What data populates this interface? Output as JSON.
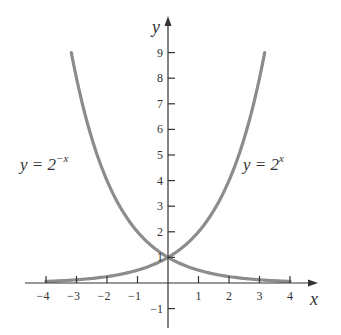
{
  "chart_data": {
    "type": "line",
    "title": "",
    "xlabel": "x",
    "ylabel": "y",
    "xlim": [
      -4.5,
      4.9
    ],
    "ylim": [
      -1.8,
      10.5
    ],
    "grid": false,
    "legend": "none (inline curve labels)",
    "x_ticks": [
      -4,
      -3,
      -2,
      -1,
      1,
      2,
      3,
      4
    ],
    "x_tick_labels": [
      "−4",
      "−3",
      "−2",
      "−1",
      "1",
      "2",
      "3",
      "4"
    ],
    "y_ticks": [
      -1,
      1,
      2,
      3,
      4,
      5,
      6,
      7,
      8,
      9
    ],
    "y_tick_labels": [
      "−1",
      "1",
      "2",
      "3",
      "4",
      "5",
      "6",
      "7",
      "8",
      "9"
    ],
    "series": [
      {
        "name": "y = 2^-x",
        "label_base": "y = 2",
        "label_exp": "−x",
        "x": [
          -3.17,
          -3,
          -2.5,
          -2,
          -1.5,
          -1,
          -0.5,
          0,
          0.5,
          1,
          1.5,
          2,
          2.5,
          3,
          3.5,
          4
        ],
        "values": [
          9.0,
          8.0,
          5.66,
          4.0,
          2.83,
          2.0,
          1.41,
          1.0,
          0.71,
          0.5,
          0.35,
          0.25,
          0.18,
          0.125,
          0.09,
          0.0625
        ]
      },
      {
        "name": "y = 2^x",
        "label_base": "y = 2",
        "label_exp": "x",
        "x": [
          -4,
          -3.5,
          -3,
          -2.5,
          -2,
          -1.5,
          -1,
          -0.5,
          0,
          0.5,
          1,
          1.5,
          2,
          2.5,
          3,
          3.17
        ],
        "values": [
          0.0625,
          0.09,
          0.125,
          0.18,
          0.25,
          0.35,
          0.5,
          0.71,
          1.0,
          1.41,
          2.0,
          2.83,
          4.0,
          5.66,
          8.0,
          9.0
        ]
      }
    ],
    "annotations": [
      {
        "text": "y = 2^−x",
        "near": [
          -3.8,
          5.2
        ]
      },
      {
        "text": "y = 2^x",
        "near": [
          2.6,
          5.2
        ]
      }
    ]
  },
  "colors": {
    "curve": "#8c8c8c",
    "axis": "#333333",
    "background": "#ffffff"
  }
}
